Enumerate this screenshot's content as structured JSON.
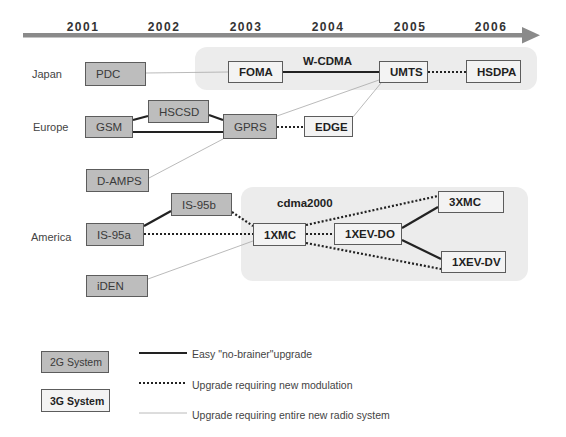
{
  "timeline": {
    "years": [
      "2001",
      "2002",
      "2003",
      "2004",
      "2005",
      "2006"
    ],
    "arrow_color": "#8a8a8a"
  },
  "regions": {
    "japan": "Japan",
    "europe": "Europe",
    "america": "America"
  },
  "groups": {
    "wcdma": "W-CDMA",
    "cdma2000": "cdma2000"
  },
  "systems": {
    "pdc": {
      "label": "PDC",
      "generation": "2G"
    },
    "foma": {
      "label": "FOMA",
      "generation": "3G"
    },
    "umts": {
      "label": "UMTS",
      "generation": "3G"
    },
    "hsdpa": {
      "label": "HSDPA",
      "generation": "3G"
    },
    "gsm": {
      "label": "GSM",
      "generation": "2G"
    },
    "hscsd": {
      "label": "HSCSD",
      "generation": "2G"
    },
    "gprs": {
      "label": "GPRS",
      "generation": "2G"
    },
    "edge": {
      "label": "EDGE",
      "generation": "3G"
    },
    "damps": {
      "label": "D-AMPS",
      "generation": "2G"
    },
    "is95b": {
      "label": "IS-95b",
      "generation": "2G"
    },
    "is95a": {
      "label": "IS-95a",
      "generation": "2G"
    },
    "iden": {
      "label": "iDEN",
      "generation": "2G"
    },
    "x1mc": {
      "label": "1XMC",
      "generation": "3G"
    },
    "x1evdo": {
      "label": "1XEV-DO",
      "generation": "3G"
    },
    "x3mc": {
      "label": "3XMC",
      "generation": "3G"
    },
    "x1evdv": {
      "label": "1XEV-DV",
      "generation": "3G"
    }
  },
  "connections": [
    {
      "from": "PDC",
      "to": "FOMA",
      "type": "new-radio-system"
    },
    {
      "from": "FOMA",
      "to": "UMTS",
      "type": "easy"
    },
    {
      "from": "UMTS",
      "to": "HSDPA",
      "type": "new-modulation"
    },
    {
      "from": "GSM",
      "to": "HSCSD",
      "type": "easy"
    },
    {
      "from": "HSCSD",
      "to": "GPRS",
      "type": "easy"
    },
    {
      "from": "GSM",
      "to": "GPRS",
      "type": "easy"
    },
    {
      "from": "GPRS",
      "to": "EDGE",
      "type": "new-modulation"
    },
    {
      "from": "GPRS",
      "to": "UMTS",
      "type": "new-radio-system"
    },
    {
      "from": "EDGE",
      "to": "UMTS",
      "type": "new-radio-system"
    },
    {
      "from": "D-AMPS",
      "to": "GPRS",
      "type": "new-radio-system"
    },
    {
      "from": "IS-95a",
      "to": "IS-95b",
      "type": "easy"
    },
    {
      "from": "IS-95b",
      "to": "1XMC",
      "type": "new-modulation"
    },
    {
      "from": "IS-95a",
      "to": "1XMC",
      "type": "new-modulation"
    },
    {
      "from": "iDEN",
      "to": "1XMC",
      "type": "new-radio-system"
    },
    {
      "from": "1XMC",
      "to": "3XMC",
      "type": "new-modulation"
    },
    {
      "from": "1XMC",
      "to": "1XEV-DO",
      "type": "new-modulation"
    },
    {
      "from": "1XMC",
      "to": "1XEV-DV",
      "type": "new-modulation"
    },
    {
      "from": "1XEV-DO",
      "to": "3XMC",
      "type": "easy"
    },
    {
      "from": "1XEV-DO",
      "to": "1XEV-DV",
      "type": "easy"
    }
  ],
  "legend": {
    "g2_label": "2G System",
    "g3_label": "3G System",
    "easy": "Easy \"no-brainer\"upgrade",
    "new_modulation": "Upgrade requiring new modulation",
    "new_radio": "Upgrade requiring entire new radio system"
  },
  "colors": {
    "g2_fill": "#bdbdbd",
    "g3_fill": "#f3f3f3",
    "group_bg": "#ececec",
    "border": "#5c5c5c"
  }
}
